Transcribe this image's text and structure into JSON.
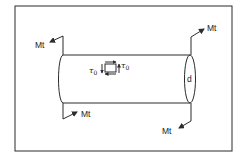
{
  "diagram": {
    "title": "",
    "frame": {
      "x": 15,
      "y": 6,
      "width": 217,
      "height": 145,
      "color": "#2b2b2b"
    },
    "shaft": {
      "top_y": 55,
      "bottom_y": 103,
      "left_x": 60,
      "right_x": 190,
      "end_label": "d"
    },
    "torques": [
      {
        "id": "left-top",
        "label": "Mt"
      },
      {
        "id": "left-bottom",
        "label": "Mt"
      },
      {
        "id": "right-top",
        "label": "Mt"
      },
      {
        "id": "right-bottom",
        "label": "Mt"
      }
    ],
    "shear_element": {
      "label_left": "τ",
      "label_left_sub": "0",
      "label_right": "τ",
      "label_right_sub": "0"
    }
  }
}
